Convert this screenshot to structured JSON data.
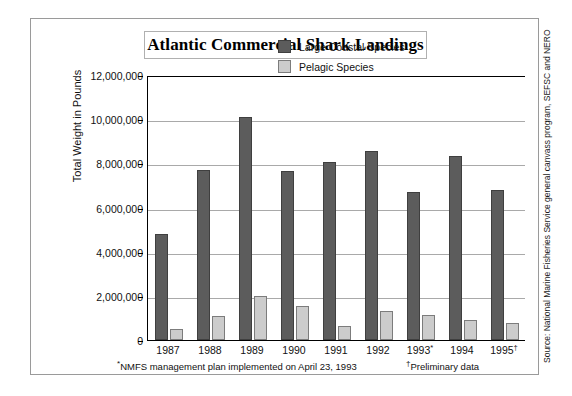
{
  "chart_data": {
    "type": "bar",
    "title": "Atlantic Commercial Shark Landings",
    "xlabel": "",
    "ylabel": "Total Weight in Pounds",
    "categories": [
      "1987",
      "1988",
      "1989",
      "1990",
      "1991",
      "1992",
      "1993*",
      "1994",
      "1995†"
    ],
    "series": [
      {
        "name": "Large Coastal Species",
        "color": "#5c5c5c",
        "values": [
          4800000,
          7700000,
          10100000,
          7650000,
          8050000,
          8550000,
          6700000,
          8350000,
          6800000
        ]
      },
      {
        "name": "Pelagic Species",
        "color": "#cccccc",
        "values": [
          500000,
          1100000,
          2000000,
          1550000,
          650000,
          1300000,
          1150000,
          900000,
          750000
        ]
      }
    ],
    "ylim": [
      0,
      12000000
    ],
    "yticks": [
      0,
      2000000,
      4000000,
      6000000,
      8000000,
      10000000,
      12000000
    ],
    "ytick_labels": [
      "0",
      "2,000,000",
      "4,000,000",
      "6,000,000",
      "8,000,000",
      "10,000,000",
      "12,000,000"
    ],
    "grid": true,
    "legend_position": "top-right"
  },
  "legend": {
    "items": [
      {
        "label": "Large Coastal Species",
        "swatch": "large"
      },
      {
        "label": "Pelagic Species",
        "swatch": "pelagic"
      }
    ]
  },
  "footnotes": {
    "left_mark": "*",
    "left_text": "NMFS management plan implemented on April 23, 1993",
    "right_mark": "†",
    "right_text": "Preliminary data"
  },
  "source": {
    "text": "Source: National Marine Fisheries Service general canvass program, SEFSC and NERO"
  }
}
